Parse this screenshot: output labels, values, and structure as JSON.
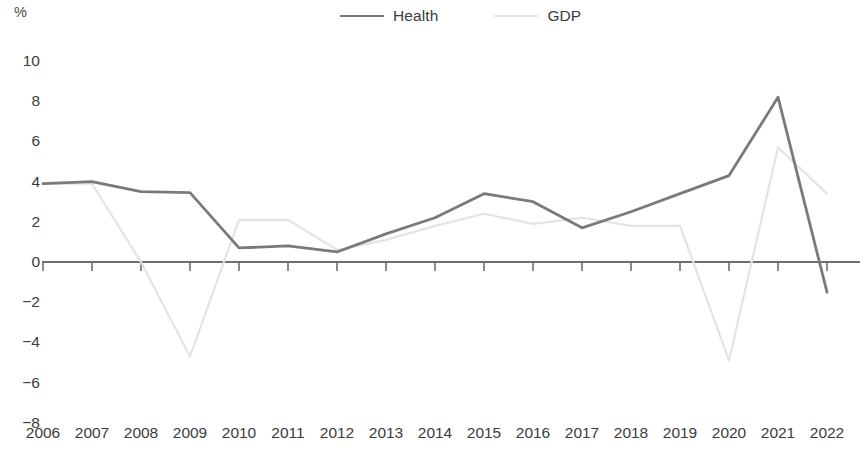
{
  "axis_unit_label": "%",
  "legend": {
    "position": "top-center",
    "entries": [
      {
        "label": "Health",
        "color": "#7a7a7a",
        "style": "solid"
      },
      {
        "label": "GDP",
        "color": "#e2e2e2",
        "style": "dashed"
      }
    ]
  },
  "chart_data": {
    "type": "line",
    "title": "",
    "subtitle": "",
    "xlabel": "",
    "ylabel": "%",
    "ylim": [
      -8,
      10
    ],
    "ytick_labels": [
      "10",
      "8",
      "6",
      "4",
      "2",
      "0",
      "-2",
      "-4",
      "-6",
      "-8"
    ],
    "ytick_values": [
      10,
      8,
      6,
      4,
      2,
      0,
      -2,
      -4,
      -6,
      -8
    ],
    "grid": false,
    "zero_line": true,
    "categories": [
      "2006",
      "2007",
      "2008",
      "2009",
      "2010",
      "2011",
      "2012",
      "2013",
      "2014",
      "2015",
      "2016",
      "2017",
      "2018",
      "2019",
      "2020",
      "2021",
      "2022"
    ],
    "x": [
      2006,
      2007,
      2008,
      2009,
      2010,
      2011,
      2012,
      2013,
      2014,
      2015,
      2016,
      2017,
      2018,
      2019,
      2020,
      2021,
      2022
    ],
    "series": [
      {
        "name": "Health",
        "color": "#7a7a7a",
        "style": "solid",
        "values": [
          3.9,
          4.0,
          3.5,
          3.45,
          0.7,
          0.8,
          0.5,
          1.4,
          2.2,
          3.4,
          3.0,
          1.7,
          2.5,
          3.4,
          4.3,
          8.2,
          -1.5
        ]
      },
      {
        "name": "GDP",
        "color": "#e4e4e4",
        "style": "dashed",
        "values": [
          3.9,
          3.9,
          0.0,
          -4.7,
          2.1,
          2.1,
          0.6,
          1.1,
          1.8,
          2.4,
          1.9,
          2.2,
          1.8,
          1.8,
          -4.9,
          5.7,
          3.4
        ]
      }
    ]
  }
}
